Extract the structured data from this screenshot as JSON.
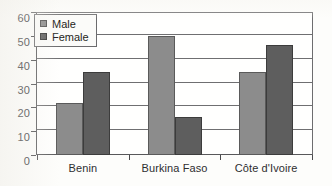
{
  "chart_data": {
    "type": "bar",
    "title": "",
    "subtitle": "",
    "xlabel": "",
    "ylabel": "",
    "categories": [
      "Benin",
      "Burkina Faso",
      "Côte d'Ivoire"
    ],
    "series": [
      {
        "name": "Male",
        "color": "#8c8c8c",
        "values": [
          22,
          50,
          35
        ]
      },
      {
        "name": "Female",
        "color": "#5e5e5e",
        "values": [
          35,
          16,
          46
        ]
      }
    ],
    "ylim": [
      0,
      60
    ],
    "ytick_labels": [
      "0",
      "10",
      "20",
      "30",
      "40",
      "50",
      "60"
    ],
    "ytick_values": [
      0,
      10,
      20,
      30,
      40,
      50,
      60
    ],
    "grid": "horizontal",
    "legend_position": "top-left-inside",
    "legend_entries": [
      "Male",
      "Female"
    ],
    "bar_grouping": "grouped-adjacent"
  },
  "legend": {
    "items": [
      {
        "label": "Male",
        "swatch": "legend-swatch-male"
      },
      {
        "label": "Female",
        "swatch": "legend-swatch-female"
      }
    ]
  }
}
